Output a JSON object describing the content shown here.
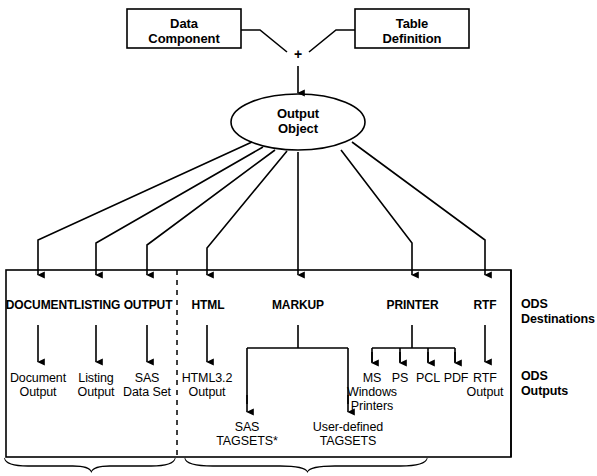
{
  "diagram": {
    "top_boxes": [
      {
        "id": "data-component",
        "label": "Data\nComponent"
      },
      {
        "id": "table-definition",
        "label": "Table\nDefinition"
      }
    ],
    "combiner_symbol": "+",
    "center_node": {
      "id": "output-object",
      "label": "Output\nObject",
      "shape": "ellipse"
    },
    "side_labels": {
      "destinations": "ODS\nDestinations",
      "outputs": "ODS\nOutputs"
    },
    "destinations": [
      {
        "id": "document",
        "label": "DOCUMENT"
      },
      {
        "id": "listing",
        "label": "LISTING"
      },
      {
        "id": "output",
        "label": "OUTPUT"
      },
      {
        "id": "html",
        "label": "HTML"
      },
      {
        "id": "markup",
        "label": "MARKUP"
      },
      {
        "id": "printer",
        "label": "PRINTER"
      },
      {
        "id": "rtf",
        "label": "RTF"
      }
    ],
    "outputs": [
      {
        "id": "document-output",
        "label": "Document\nOutput"
      },
      {
        "id": "listing-output",
        "label": "Listing\nOutput"
      },
      {
        "id": "sas-data-set",
        "label": "SAS\nData Set"
      },
      {
        "id": "html32-output",
        "label": "HTML3.2\nOutput"
      },
      {
        "id": "ms-windows-printers",
        "label": "MS\nWindows\nPrinters"
      },
      {
        "id": "ps",
        "label": "PS"
      },
      {
        "id": "pcl",
        "label": "PCL"
      },
      {
        "id": "pdf",
        "label": "PDF"
      },
      {
        "id": "rtf-output",
        "label": "RTF\nOutput"
      }
    ],
    "markup_children": [
      {
        "id": "sas-tagsets",
        "label": "SAS\nTAGSETS*"
      },
      {
        "id": "user-defined-tagsets",
        "label": "User-defined\nTAGSETS"
      }
    ],
    "colors": {
      "stroke": "#000000",
      "background": "#ffffff",
      "text": "#000000"
    }
  }
}
